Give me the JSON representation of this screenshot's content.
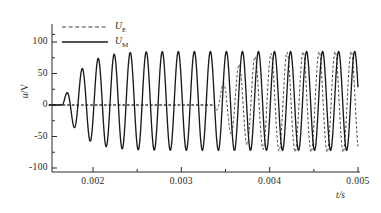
{
  "chart_data": {
    "type": "line",
    "title": "",
    "xlabel": "t/s",
    "ylabel": "u/V",
    "xlim": [
      0.0015,
      0.005
    ],
    "ylim": [
      -100,
      112
    ],
    "grid": false,
    "legend_position": "top-left-inside",
    "x_ticks_major": [
      "0.002",
      "0.003",
      "0.004",
      "0.005"
    ],
    "x_tick_values": [
      0.002,
      0.003,
      0.004,
      0.005
    ],
    "x_minor_tick_values": [
      0.0025,
      0.0035,
      0.0045
    ],
    "y_ticks_major": [
      "100",
      "50",
      "0",
      "-50",
      "-100"
    ],
    "y_tick_values": [
      100,
      50,
      0,
      -50,
      -100
    ],
    "y_minor_tick_values": [
      75,
      25,
      -25,
      -75
    ],
    "series": [
      {
        "name": "U_E",
        "label": "U",
        "sub": "E",
        "style": "dashed",
        "color": "#2b2b2b",
        "description": "Excitation voltage: zero until t=0.00337 s, then sinusoidal oscillation ramping to amplitude 80 V, phase-shifted ahead of U_M",
        "start_time": 0.00337,
        "amplitude": 80,
        "offset": 5,
        "frequency_hz": 5510,
        "phase_deg": 250
      },
      {
        "name": "U_M",
        "label": "U",
        "sub": "M",
        "style": "solid",
        "color": "#1a1a1a",
        "description": "Measured voltage: zero until t=0.00165 s, first peak 60 V then steady sinusoid with peak 85 V and trough -72 V",
        "start_time": 0.00165,
        "amplitude": 78.5,
        "offset": 6.5,
        "frequency_hz": 5510,
        "phase_deg": 0,
        "first_peak_value": 60
      }
    ]
  },
  "legend": {
    "entries": [
      {
        "label": "U",
        "sub": "E",
        "style": "dashed"
      },
      {
        "label": "U",
        "sub": "M",
        "style": "solid"
      }
    ]
  },
  "axes": {
    "x_axis_title": "t/s",
    "y_axis_title_num": "u",
    "y_axis_title_den": "V"
  }
}
